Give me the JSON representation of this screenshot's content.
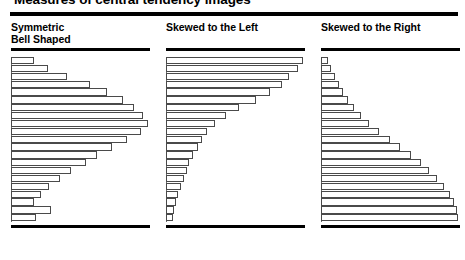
{
  "page": {
    "title": "Measures of central tendency images",
    "title_clipped": true,
    "background_color": "#ffffff",
    "rule_color": "#000000"
  },
  "chart_data": [
    {
      "type": "bar",
      "orientation": "horizontal",
      "title": "Symmetric Bell Shaped",
      "title_lines": [
        "Symmetric",
        "Bell Shaped"
      ],
      "xlabel": "",
      "ylabel": "",
      "grid": false,
      "legend": null,
      "axis_ticks": false,
      "bar_fill": "#ffffff",
      "bar_outline": "#4a4a4a",
      "categories": [
        "1",
        "2",
        "3",
        "4",
        "5",
        "6",
        "7",
        "8",
        "9",
        "10",
        "11",
        "12",
        "13",
        "14",
        "15",
        "16",
        "17",
        "18",
        "19",
        "20",
        "21"
      ],
      "values": [
        17,
        27,
        41,
        58,
        70,
        82,
        90,
        96,
        100,
        95,
        85,
        74,
        63,
        55,
        44,
        36,
        28,
        22,
        17,
        29,
        18
      ],
      "xlim": [
        0,
        100
      ]
    },
    {
      "type": "bar",
      "orientation": "horizontal",
      "title": "Skewed to the Left",
      "title_lines": [
        "Skewed to the Left"
      ],
      "xlabel": "",
      "ylabel": "",
      "grid": false,
      "legend": null,
      "axis_ticks": false,
      "bar_fill": "#ffffff",
      "bar_outline": "#4a4a4a",
      "categories": [
        "1",
        "2",
        "3",
        "4",
        "5",
        "6",
        "7",
        "8",
        "9",
        "10",
        "11",
        "12",
        "13",
        "14",
        "15",
        "16",
        "17",
        "18",
        "19",
        "20",
        "21"
      ],
      "values": [
        100,
        96,
        90,
        85,
        76,
        66,
        53,
        44,
        36,
        30,
        26,
        23,
        20,
        17,
        15,
        13,
        11,
        9,
        7,
        6,
        5
      ],
      "xlim": [
        0,
        100
      ]
    },
    {
      "type": "bar",
      "orientation": "horizontal",
      "title": "Skewed to the Right",
      "title_lines": [
        "Skewed to the Right"
      ],
      "xlabel": "",
      "ylabel": "",
      "grid": false,
      "legend": null,
      "axis_ticks": false,
      "bar_fill": "#ffffff",
      "bar_outline": "#4a4a4a",
      "categories": [
        "1",
        "2",
        "3",
        "4",
        "5",
        "6",
        "7",
        "8",
        "9",
        "10",
        "11",
        "12",
        "13",
        "14",
        "15",
        "16",
        "17",
        "18",
        "19",
        "20",
        "21"
      ],
      "values": [
        5,
        7,
        10,
        13,
        16,
        20,
        24,
        29,
        35,
        42,
        50,
        58,
        66,
        73,
        79,
        85,
        90,
        94,
        97,
        99,
        100
      ],
      "xlim": [
        0,
        100
      ]
    }
  ]
}
